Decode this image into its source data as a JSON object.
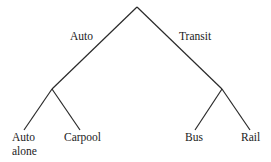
{
  "diagram": {
    "type": "tree",
    "root": {
      "children": [
        {
          "label": "Auto",
          "children": [
            {
              "label_lines": [
                "Auto",
                "alone"
              ]
            },
            {
              "label_lines": [
                "Carpool"
              ]
            }
          ]
        },
        {
          "label": "Transit",
          "children": [
            {
              "label_lines": [
                "Bus"
              ]
            },
            {
              "label_lines": [
                "Rail"
              ]
            }
          ]
        }
      ]
    },
    "labels": {
      "branch_auto": "Auto",
      "branch_transit": "Transit",
      "leaf_auto_alone_line1": "Auto",
      "leaf_auto_alone_line2": "alone",
      "leaf_carpool": "Carpool",
      "leaf_bus": "Bus",
      "leaf_rail": "Rail"
    }
  }
}
